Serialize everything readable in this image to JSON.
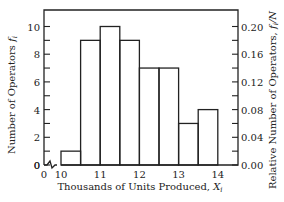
{
  "chart_data": {
    "type": "bar",
    "subtype": "histogram",
    "title": "",
    "xlabel": "Thousands of Units Produced, X_i",
    "ylabel": "Number of Operators f_i",
    "ylabel_right": "Relative Number of Operators, f_i/N",
    "bins": [
      {
        "from": 10.0,
        "to": 10.5,
        "value": 1
      },
      {
        "from": 10.5,
        "to": 11.0,
        "value": 9
      },
      {
        "from": 11.0,
        "to": 11.5,
        "value": 10
      },
      {
        "from": 11.5,
        "to": 12.0,
        "value": 9
      },
      {
        "from": 12.0,
        "to": 12.5,
        "value": 7
      },
      {
        "from": 12.5,
        "to": 13.0,
        "value": 7
      },
      {
        "from": 13.0,
        "to": 13.5,
        "value": 3
      },
      {
        "from": 13.5,
        "to": 14.0,
        "value": 4
      }
    ],
    "categories": [
      "10.0-10.5",
      "10.5-11.0",
      "11.0-11.5",
      "11.5-12.0",
      "12.0-12.5",
      "12.5-13.0",
      "13.0-13.5",
      "13.5-14.0"
    ],
    "values": [
      1,
      9,
      10,
      9,
      7,
      7,
      3,
      4
    ],
    "relative_values": [
      0.02,
      0.18,
      0.2,
      0.18,
      0.14,
      0.14,
      0.06,
      0.08
    ],
    "N": 50,
    "x_ticks": [
      "0",
      "10",
      "11",
      "12",
      "13",
      "14"
    ],
    "y_ticks_left": [
      "0",
      "2",
      "4",
      "6",
      "8",
      "10"
    ],
    "y_ticks_right": [
      "0.00",
      "0.04",
      "0.08",
      "0.12",
      "0.16",
      "0.20"
    ],
    "ylim": [
      0,
      10.5
    ],
    "ylim_right": [
      0,
      0.21
    ],
    "x_axis_break": true,
    "grid": false,
    "legend": null
  },
  "labels": {
    "x_title": "Thousands of Units Produced, ",
    "x_title_var": "X",
    "x_title_sub": "i",
    "y_title": "Number of Operators ",
    "y_title_var": "f",
    "y_title_sub": "i",
    "y2_title": "Relative Number of Operators, ",
    "y2_title_var": "f",
    "y2_title_sub": "i",
    "y2_title_tail": "/N"
  }
}
